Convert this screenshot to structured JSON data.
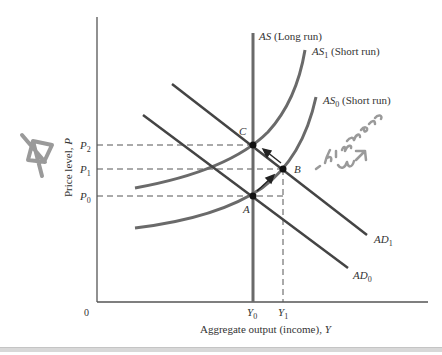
{
  "diagram": {
    "type": "AS-AD model",
    "axes": {
      "origin_label": "0",
      "x_label": "Aggregate output (income), ",
      "x_label_var": "Y",
      "y_label": "Price level, ",
      "y_label_var": "P"
    },
    "ticks": {
      "y": [
        {
          "base": "P",
          "sub": "2"
        },
        {
          "base": "P",
          "sub": "1"
        },
        {
          "base": "P",
          "sub": "0"
        }
      ],
      "x": [
        {
          "base": "Y",
          "sub": "0"
        },
        {
          "base": "Y",
          "sub": "1"
        }
      ]
    },
    "curves": {
      "as_long_run": {
        "name": "AS",
        "note": " (Long run)"
      },
      "as1": {
        "name": "AS",
        "sub": "1",
        "note": " (Short run)"
      },
      "as0": {
        "name": "AS",
        "sub": "0",
        "note": " (Short run)"
      },
      "ad1": {
        "name": "AD",
        "sub": "1"
      },
      "ad0": {
        "name": "AD",
        "sub": "0"
      }
    },
    "points": {
      "a": "A",
      "b": "B",
      "c": "C"
    },
    "annotation": {
      "handwritten_text": "- hire more workers",
      "doodle": "star"
    }
  },
  "colors": {
    "axis": "#555555",
    "as_curves": "#6a6a6a",
    "ad_curves": "#444444",
    "dashed": "#555555",
    "points": "#111111",
    "handwriting": "#9a9a9a"
  }
}
